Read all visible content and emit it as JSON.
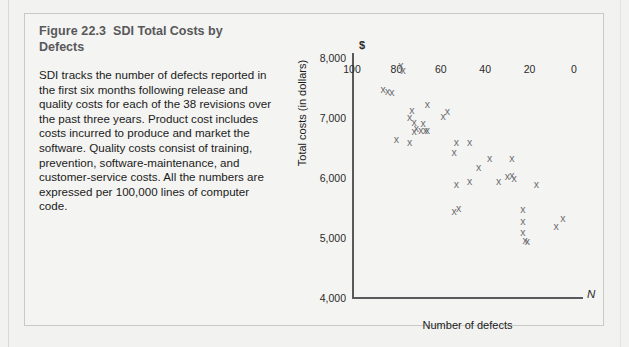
{
  "figure": {
    "number": "Figure 22.3",
    "name": "SDI Total Costs by Defects",
    "description": "SDI tracks the number of defects reported in the first six months following release and quality costs for each of the 38 revisions over the past three years. Product cost includes costs incurred to produce and market the software. Quality costs consist of training, prevention, software-maintenance, and customer-service costs. All the numbers are expressed per 100,000 lines of computer code."
  },
  "chart_data": {
    "type": "scatter",
    "title": "SDI Total Costs by Defects",
    "xlabel": "Number of defects",
    "ylabel": "Total costs (in dollars)",
    "x_axis_symbol": "N",
    "y_axis_symbol": "$",
    "xlim": [
      100,
      0
    ],
    "ylim": [
      4000,
      8000
    ],
    "x_reversed": true,
    "grid": false,
    "legend": null,
    "xticks": [
      100,
      80,
      60,
      40,
      20,
      0
    ],
    "xtick_labels": [
      "100",
      "80",
      "60",
      "40",
      "20",
      "0"
    ],
    "yticks": [
      4000,
      5000,
      6000,
      7000,
      8000
    ],
    "ytick_labels": [
      "4,000",
      "5,000",
      "6,000",
      "7,000",
      "8,000"
    ],
    "marker": "x",
    "marker_color": "#6e6e72",
    "n_points": 38,
    "points": [
      {
        "x": 78,
        "y": 7880
      },
      {
        "x": 77,
        "y": 7790
      },
      {
        "x": 86,
        "y": 7480
      },
      {
        "x": 84,
        "y": 7440
      },
      {
        "x": 82,
        "y": 7420
      },
      {
        "x": 73,
        "y": 7130
      },
      {
        "x": 74,
        "y": 7010
      },
      {
        "x": 66,
        "y": 7230
      },
      {
        "x": 72,
        "y": 6930
      },
      {
        "x": 68,
        "y": 6910
      },
      {
        "x": 71,
        "y": 6820
      },
      {
        "x": 69,
        "y": 6800
      },
      {
        "x": 67,
        "y": 6790
      },
      {
        "x": 66,
        "y": 6790
      },
      {
        "x": 80,
        "y": 6640
      },
      {
        "x": 74,
        "y": 6590
      },
      {
        "x": 72,
        "y": 6780
      },
      {
        "x": 57,
        "y": 7110
      },
      {
        "x": 59,
        "y": 7020
      },
      {
        "x": 53,
        "y": 6590
      },
      {
        "x": 54,
        "y": 6430
      },
      {
        "x": 47,
        "y": 6600
      },
      {
        "x": 43,
        "y": 6180
      },
      {
        "x": 38,
        "y": 6330
      },
      {
        "x": 53,
        "y": 5900
      },
      {
        "x": 47,
        "y": 5940
      },
      {
        "x": 28,
        "y": 6330
      },
      {
        "x": 34,
        "y": 5950
      },
      {
        "x": 30,
        "y": 6020
      },
      {
        "x": 28,
        "y": 6040
      },
      {
        "x": 27,
        "y": 5990
      },
      {
        "x": 17,
        "y": 5900
      },
      {
        "x": 54,
        "y": 5450
      },
      {
        "x": 52,
        "y": 5500
      },
      {
        "x": 23,
        "y": 5470
      },
      {
        "x": 23,
        "y": 5270
      },
      {
        "x": 23,
        "y": 5090
      },
      {
        "x": 22,
        "y": 4960
      },
      {
        "x": 21,
        "y": 4950
      },
      {
        "x": 8,
        "y": 5200
      },
      {
        "x": 5,
        "y": 5330
      }
    ]
  }
}
